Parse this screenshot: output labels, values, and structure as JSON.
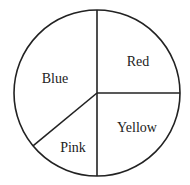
{
  "chart_data": {
    "type": "pie",
    "title": "",
    "categories": [
      "Red",
      "Yellow",
      "Pink",
      "Blue"
    ],
    "values": [
      25,
      25,
      14,
      36
    ],
    "unit": "percent (estimated from slice angles)",
    "start_angle_deg": 0,
    "direction": "clockwise from 12 o'clock",
    "fill": "#ffffff",
    "stroke": "#222222",
    "labels_inside": true,
    "legend": "none"
  },
  "labels": {
    "red": "Red",
    "yellow": "Yellow",
    "pink": "Pink",
    "blue": "Blue"
  }
}
